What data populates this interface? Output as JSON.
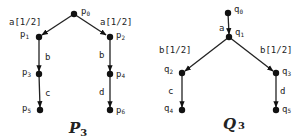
{
  "diagrams": [
    {
      "title": "P",
      "title_sub": "3",
      "nodes": [
        {
          "id": "p0",
          "name": "p",
          "sub": "0"
        },
        {
          "id": "p1",
          "name": "p",
          "sub": "1"
        },
        {
          "id": "p2",
          "name": "p",
          "sub": "2"
        },
        {
          "id": "p3",
          "name": "p",
          "sub": "3"
        },
        {
          "id": "p4",
          "name": "p",
          "sub": "4"
        },
        {
          "id": "p5",
          "name": "p",
          "sub": "5"
        },
        {
          "id": "p6",
          "name": "p",
          "sub": "6"
        }
      ],
      "edges": [
        {
          "from": "p0",
          "to": "p1",
          "label": "a[1/2]"
        },
        {
          "from": "p0",
          "to": "p2",
          "label": "a[1/2]"
        },
        {
          "from": "p1",
          "to": "p3",
          "label": "b"
        },
        {
          "from": "p2",
          "to": "p4",
          "label": "b"
        },
        {
          "from": "p3",
          "to": "p5",
          "label": "c"
        },
        {
          "from": "p4",
          "to": "p6",
          "label": "d"
        }
      ]
    },
    {
      "title": "Q",
      "title_sub": "3",
      "nodes": [
        {
          "id": "q0",
          "name": "q",
          "sub": "0"
        },
        {
          "id": "q1",
          "name": "q",
          "sub": "1"
        },
        {
          "id": "q2",
          "name": "q",
          "sub": "2"
        },
        {
          "id": "q3",
          "name": "q",
          "sub": "3"
        },
        {
          "id": "q4",
          "name": "q",
          "sub": "4"
        },
        {
          "id": "q5",
          "name": "q",
          "sub": "5"
        }
      ],
      "edges": [
        {
          "from": "q0",
          "to": "q1",
          "label": "a"
        },
        {
          "from": "q1",
          "to": "q2",
          "label": "b[1/2]"
        },
        {
          "from": "q1",
          "to": "q3",
          "label": "b[1/2]"
        },
        {
          "from": "q2",
          "to": "q4",
          "label": "c"
        },
        {
          "from": "q3",
          "to": "q5",
          "label": "d"
        }
      ]
    }
  ]
}
